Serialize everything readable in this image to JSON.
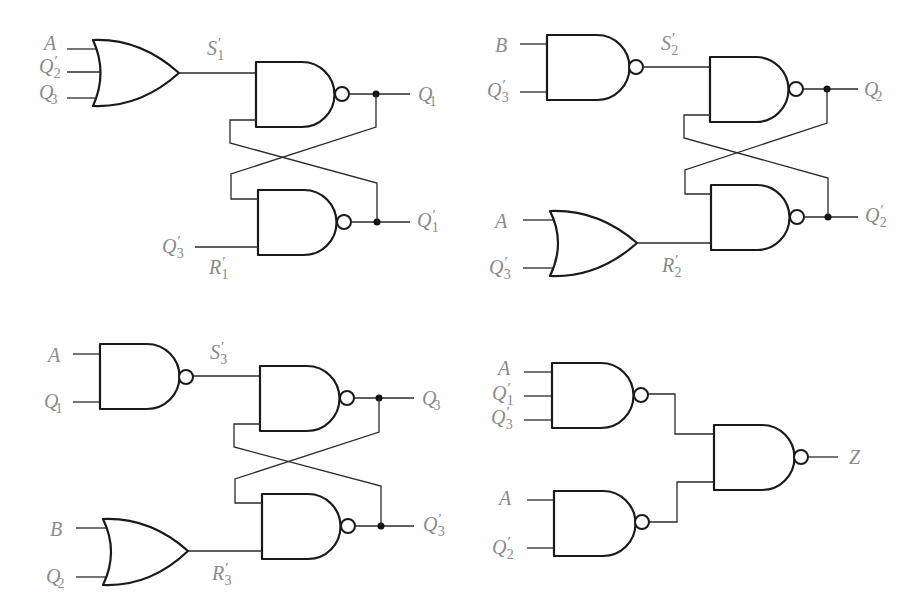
{
  "colors": {
    "gate_stroke": "#1a1a1a",
    "wire": "#2a2a2a",
    "label": "#8a8a8a",
    "background": "#ffffff"
  },
  "circuits": [
    {
      "id": "q1-latch",
      "input_gate": {
        "type": "OR",
        "inputs": [
          {
            "name": "A",
            "prime": "",
            "sub": ""
          },
          {
            "name": "Q",
            "prime": "′",
            "sub": "2"
          },
          {
            "name": "Q",
            "prime": "",
            "sub": "3"
          }
        ]
      },
      "set_label": {
        "name": "S",
        "prime": "′",
        "sub": "1"
      },
      "reset_input": {
        "name": "Q",
        "prime": "′",
        "sub": "3"
      },
      "reset_label": {
        "name": "R",
        "prime": "′",
        "sub": "1"
      },
      "outputs": [
        {
          "name": "Q",
          "prime": "",
          "sub": "1"
        },
        {
          "name": "Q",
          "prime": "′",
          "sub": "1"
        }
      ]
    },
    {
      "id": "q2-latch",
      "input_gate": {
        "type": "NAND",
        "inputs": [
          {
            "name": "B",
            "prime": "",
            "sub": ""
          },
          {
            "name": "Q",
            "prime": "′",
            "sub": "3"
          }
        ]
      },
      "set_label": {
        "name": "S",
        "prime": "′",
        "sub": "2"
      },
      "reset_gate": {
        "type": "OR",
        "inputs": [
          {
            "name": "A",
            "prime": "",
            "sub": ""
          },
          {
            "name": "Q",
            "prime": "′",
            "sub": "3"
          }
        ]
      },
      "reset_label": {
        "name": "R",
        "prime": "′",
        "sub": "2"
      },
      "outputs": [
        {
          "name": "Q",
          "prime": "",
          "sub": "2"
        },
        {
          "name": "Q",
          "prime": "′",
          "sub": "2"
        }
      ]
    },
    {
      "id": "q3-latch",
      "input_gate": {
        "type": "NAND",
        "inputs": [
          {
            "name": "A",
            "prime": "",
            "sub": ""
          },
          {
            "name": "Q",
            "prime": "",
            "sub": "1"
          }
        ]
      },
      "set_label": {
        "name": "S",
        "prime": "′",
        "sub": "3"
      },
      "reset_gate": {
        "type": "OR",
        "inputs": [
          {
            "name": "B",
            "prime": "",
            "sub": ""
          },
          {
            "name": "Q",
            "prime": "",
            "sub": "2"
          }
        ]
      },
      "reset_label": {
        "name": "R",
        "prime": "′",
        "sub": "3"
      },
      "outputs": [
        {
          "name": "Q",
          "prime": "",
          "sub": "3"
        },
        {
          "name": "Q",
          "prime": "′",
          "sub": "3"
        }
      ]
    },
    {
      "id": "z-output",
      "gate1": {
        "type": "NAND",
        "inputs": [
          {
            "name": "A",
            "prime": "",
            "sub": ""
          },
          {
            "name": "Q",
            "prime": "′",
            "sub": "1"
          },
          {
            "name": "Q",
            "prime": "′",
            "sub": "3"
          }
        ]
      },
      "gate2": {
        "type": "NAND",
        "inputs": [
          {
            "name": "A",
            "prime": "",
            "sub": ""
          },
          {
            "name": "Q",
            "prime": "′",
            "sub": "2"
          }
        ]
      },
      "final_gate": {
        "type": "NAND"
      },
      "output": {
        "name": "Z",
        "prime": "",
        "sub": ""
      }
    }
  ]
}
